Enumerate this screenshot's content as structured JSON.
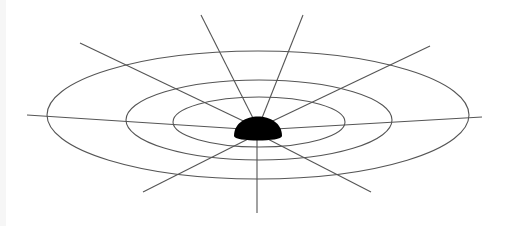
{
  "diagram": {
    "title": "",
    "colors": {
      "background": "#ffffff",
      "line": "#555555",
      "mass": "#000000"
    },
    "mass": {
      "cx": 258,
      "cy": 130,
      "rx": 24,
      "ry": 20
    },
    "rings": [
      {
        "cx": 258,
        "cy": 115,
        "rx": 211,
        "ry": 64
      },
      {
        "cx": 259,
        "cy": 120,
        "rx": 133,
        "ry": 40
      },
      {
        "cx": 259,
        "cy": 122,
        "rx": 86,
        "ry": 25
      }
    ],
    "spokes": [
      {
        "x1": 258,
        "y1": 128,
        "x2": 201,
        "y2": 15
      },
      {
        "x1": 258,
        "y1": 128,
        "x2": 303,
        "y2": 15
      },
      {
        "x1": 258,
        "y1": 128,
        "x2": 80,
        "y2": 43
      },
      {
        "x1": 258,
        "y1": 128,
        "x2": 430,
        "y2": 46
      },
      {
        "x1": 258,
        "y1": 130,
        "x2": 27,
        "y2": 115
      },
      {
        "x1": 258,
        "y1": 130,
        "x2": 482,
        "y2": 117
      },
      {
        "x1": 258,
        "y1": 134,
        "x2": 143,
        "y2": 192
      },
      {
        "x1": 258,
        "y1": 134,
        "x2": 371,
        "y2": 192
      },
      {
        "x1": 257,
        "y1": 134,
        "x2": 257,
        "y2": 213
      }
    ]
  }
}
